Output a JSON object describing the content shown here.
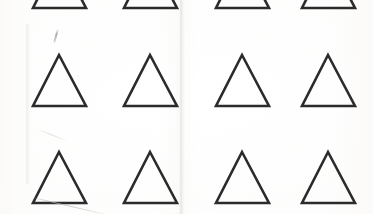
{
  "sheet": {
    "title": "Scanned sheet of hand-drawn triangles",
    "media": "photographed paper scan",
    "width": 373,
    "height": 214,
    "background_color": "#fdfdfc",
    "stroke_color": "#2b2b2b",
    "stroke_width": 2.6
  },
  "grid": {
    "columns": 4,
    "rows": 3,
    "row_labels": [
      "row-1-cropped",
      "row-2",
      "row-3"
    ],
    "column_labels": [
      "col-1",
      "col-2",
      "col-3",
      "col-4"
    ],
    "column_centers": [
      59,
      150,
      242,
      328
    ],
    "row_apex_y": [
      -44,
      55,
      152
    ],
    "row_base_y": [
      8,
      106,
      203
    ],
    "triangle_half_width": 26,
    "note": "Top row is clipped by the upper image edge; only the lower portion of each triangle is visible."
  },
  "shapes": [
    {
      "name": "triangle-r1c1",
      "row": 1,
      "col": 1,
      "apex_x": 59,
      "apex_y": -44,
      "base_left_x": 33,
      "base_right_x": 86,
      "base_y": 8,
      "clipped": true
    },
    {
      "name": "triangle-r1c2",
      "row": 1,
      "col": 2,
      "apex_x": 150,
      "apex_y": -44,
      "base_left_x": 124,
      "base_right_x": 177,
      "base_y": 8,
      "clipped": true
    },
    {
      "name": "triangle-r1c3",
      "row": 1,
      "col": 3,
      "apex_x": 242,
      "apex_y": -44,
      "base_left_x": 216,
      "base_right_x": 269,
      "base_y": 8,
      "clipped": true
    },
    {
      "name": "triangle-r1c4",
      "row": 1,
      "col": 4,
      "apex_x": 328,
      "apex_y": -44,
      "base_left_x": 302,
      "base_right_x": 355,
      "base_y": 8,
      "clipped": true
    },
    {
      "name": "triangle-r2c1",
      "row": 2,
      "col": 1,
      "apex_x": 59,
      "apex_y": 55,
      "base_left_x": 33,
      "base_right_x": 86,
      "base_y": 106,
      "clipped": false
    },
    {
      "name": "triangle-r2c2",
      "row": 2,
      "col": 2,
      "apex_x": 150,
      "apex_y": 55,
      "base_left_x": 124,
      "base_right_x": 177,
      "base_y": 106,
      "clipped": false
    },
    {
      "name": "triangle-r2c3",
      "row": 2,
      "col": 3,
      "apex_x": 242,
      "apex_y": 55,
      "base_left_x": 216,
      "base_right_x": 269,
      "base_y": 106,
      "clipped": false
    },
    {
      "name": "triangle-r2c4",
      "row": 2,
      "col": 4,
      "apex_x": 328,
      "apex_y": 55,
      "base_left_x": 302,
      "base_right_x": 355,
      "base_y": 106,
      "clipped": false
    },
    {
      "name": "triangle-r3c1",
      "row": 3,
      "col": 1,
      "apex_x": 59,
      "apex_y": 152,
      "base_left_x": 33,
      "base_right_x": 86,
      "base_y": 203,
      "clipped": false
    },
    {
      "name": "triangle-r3c2",
      "row": 3,
      "col": 2,
      "apex_x": 150,
      "apex_y": 152,
      "base_left_x": 124,
      "base_right_x": 177,
      "base_y": 203,
      "clipped": false
    },
    {
      "name": "triangle-r3c3",
      "row": 3,
      "col": 3,
      "apex_x": 242,
      "apex_y": 152,
      "base_left_x": 216,
      "base_right_x": 269,
      "base_y": 203,
      "clipped": false
    },
    {
      "name": "triangle-r3c4",
      "row": 3,
      "col": 4,
      "apex_x": 328,
      "apex_y": 152,
      "base_left_x": 302,
      "base_right_x": 355,
      "base_y": 203,
      "clipped": false
    }
  ],
  "artifacts": [
    {
      "name": "vertical-crease",
      "kind": "fold-line",
      "x": 182,
      "y_start": 0,
      "y_end": 214
    },
    {
      "name": "left-crease",
      "kind": "fold-line",
      "x": 27,
      "y_start": 24,
      "y_end": 184
    },
    {
      "name": "pencil-tick",
      "kind": "stray-mark",
      "x": 58,
      "y": 29,
      "length": 14
    },
    {
      "name": "diagonal-scratch",
      "kind": "stray-mark",
      "x": 28,
      "y": 196,
      "length": 86
    },
    {
      "name": "short-scratch",
      "kind": "stray-mark",
      "x": 36,
      "y": 128,
      "length": 34
    }
  ]
}
